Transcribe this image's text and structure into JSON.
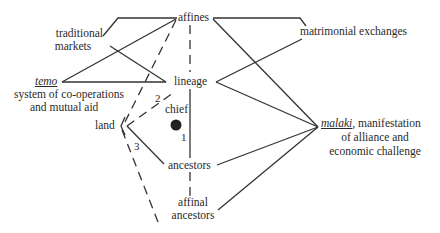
{
  "diagram": {
    "nodes": {
      "affines": "affines",
      "traditional_markets_1": "traditional",
      "traditional_markets_2": "markets",
      "matrimonial_exchanges": "matrimonial exchanges",
      "temo_term": "temo",
      "temo_desc_1": "system of co-operations",
      "temo_desc_2": "and mutual aid",
      "lineage": "lineage",
      "chief": "chief",
      "land": "land",
      "ancestors": "ancestors",
      "affinal_ancestors_1": "affinal",
      "affinal_ancestors_2": "ancestors",
      "malaki_term": "malaki",
      "malaki_desc_1": ", manifestation",
      "malaki_desc_2": "of alliance and",
      "malaki_desc_3": "economic challenge"
    },
    "edge_labels": {
      "one": "1",
      "two": "2",
      "three": "3"
    },
    "colors": {
      "line": "#333333",
      "text": "#2a2a2a",
      "chief_dot": "#222222",
      "background": "#ffffff"
    }
  }
}
